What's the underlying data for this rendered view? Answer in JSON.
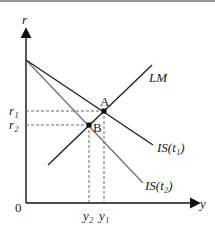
{
  "diagram": {
    "axes": {
      "y_label": "r",
      "x_label": "y",
      "origin": "0"
    },
    "curves": {
      "lm": "LM",
      "is1": "IS(t₁)",
      "is2": "IS(t₂)"
    },
    "points": {
      "a": "A",
      "b": "B"
    },
    "ticks": {
      "r1": "r₁",
      "r2": "r₂",
      "y1": "y₁",
      "y2": "y₂"
    },
    "colors": {
      "lm": "#222222",
      "is1": "#222222",
      "is2": "#777777",
      "axes": "#111111"
    }
  }
}
